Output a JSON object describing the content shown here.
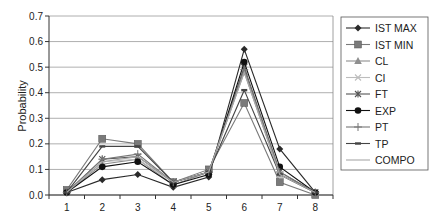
{
  "chart_data": {
    "type": "line",
    "title": "",
    "xlabel": "",
    "ylabel": "Probability",
    "ylim": [
      0,
      0.7
    ],
    "yticks": [
      "0.0",
      "0.1",
      "0.2",
      "0.3",
      "0.4",
      "0.5",
      "0.6",
      "0.7"
    ],
    "categories": [
      "1",
      "2",
      "3",
      "4",
      "5",
      "6",
      "7",
      "8"
    ],
    "grid": true,
    "legend_position": "right",
    "series": [
      {
        "name": "IST MAX",
        "marker": "diamond",
        "color": "#2a2a2a",
        "values": [
          0.01,
          0.06,
          0.08,
          0.03,
          0.07,
          0.57,
          0.18,
          0.01
        ]
      },
      {
        "name": "IST MIN",
        "marker": "square",
        "color": "#7a7a7a",
        "values": [
          0.02,
          0.22,
          0.2,
          0.05,
          0.1,
          0.36,
          0.05,
          0.0
        ]
      },
      {
        "name": "CL",
        "marker": "triangle",
        "color": "#8f8f8f",
        "values": [
          0.01,
          0.12,
          0.14,
          0.04,
          0.09,
          0.48,
          0.08,
          0.01
        ]
      },
      {
        "name": "CI",
        "marker": "x",
        "color": "#bdbdbd",
        "values": [
          0.01,
          0.13,
          0.14,
          0.05,
          0.09,
          0.49,
          0.08,
          0.01
        ]
      },
      {
        "name": "FT",
        "marker": "asterisk",
        "color": "#555555",
        "values": [
          0.01,
          0.14,
          0.15,
          0.05,
          0.09,
          0.5,
          0.09,
          0.01
        ]
      },
      {
        "name": "EXP",
        "marker": "circle",
        "color": "#111111",
        "values": [
          0.01,
          0.11,
          0.13,
          0.04,
          0.08,
          0.52,
          0.11,
          0.01
        ]
      },
      {
        "name": "PT",
        "marker": "plus",
        "color": "#777777",
        "values": [
          0.01,
          0.14,
          0.16,
          0.05,
          0.09,
          0.49,
          0.09,
          0.01
        ]
      },
      {
        "name": "TP",
        "marker": "dash",
        "color": "#444444",
        "values": [
          0.01,
          0.19,
          0.19,
          0.05,
          0.09,
          0.41,
          0.08,
          0.01
        ]
      },
      {
        "name": "COMPO",
        "marker": "none",
        "color": "#a8a8a8",
        "values": [
          0.01,
          0.13,
          0.15,
          0.05,
          0.09,
          0.48,
          0.08,
          0.01
        ]
      }
    ]
  }
}
